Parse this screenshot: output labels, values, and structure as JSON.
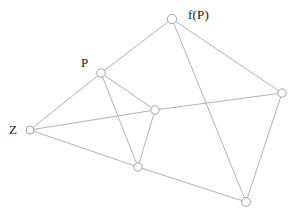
{
  "figure": {
    "name": "graph-diagram",
    "width": 293,
    "height": 217,
    "background_color": "#ffffff",
    "edge_color": "#a9a9a9",
    "node_fill_color": "#ffffff",
    "node_stroke_color": "#9a9a9a",
    "label_color": "#1a1a1a"
  },
  "chart_data": {
    "type": "scatter",
    "title": "",
    "xlabel": "",
    "ylabel": "",
    "grid": false,
    "legend": "none",
    "xlim": [
      0,
      293
    ],
    "ylim": [
      0,
      217
    ],
    "nodes": [
      {
        "id": "fP",
        "label": "f(P)",
        "x": 172,
        "y": 19,
        "r": 4.6,
        "label_x": 188,
        "label_y": 8
      },
      {
        "id": "P",
        "label": "P",
        "x": 101,
        "y": 73,
        "r": 4.2,
        "label_x": 81,
        "label_y": 56
      },
      {
        "id": "Z",
        "label": "Z",
        "x": 30,
        "y": 130,
        "r": 4.0,
        "label_x": 9,
        "label_y": 123
      },
      {
        "id": "C",
        "label": "",
        "x": 155,
        "y": 110,
        "r": 4.2,
        "label_x": null,
        "label_y": null
      },
      {
        "id": "R",
        "label": "",
        "x": 282,
        "y": 93,
        "r": 4.2,
        "label_x": null,
        "label_y": null
      },
      {
        "id": "BL",
        "label": "",
        "x": 138,
        "y": 167,
        "r": 4.2,
        "label_x": null,
        "label_y": null
      },
      {
        "id": "BR",
        "label": "",
        "x": 246,
        "y": 202,
        "r": 4.4,
        "label_x": null,
        "label_y": null
      }
    ],
    "edges": [
      {
        "from": "fP",
        "to": "P"
      },
      {
        "from": "fP",
        "to": "R"
      },
      {
        "from": "fP",
        "to": "BR"
      },
      {
        "from": "P",
        "to": "Z"
      },
      {
        "from": "P",
        "to": "C"
      },
      {
        "from": "P",
        "to": "BL"
      },
      {
        "from": "Z",
        "to": "C"
      },
      {
        "from": "Z",
        "to": "BL"
      },
      {
        "from": "C",
        "to": "R"
      },
      {
        "from": "C",
        "to": "BL"
      },
      {
        "from": "R",
        "to": "BR"
      },
      {
        "from": "BL",
        "to": "BR"
      }
    ],
    "labels": [
      "f(P)",
      "P",
      "Z"
    ]
  }
}
